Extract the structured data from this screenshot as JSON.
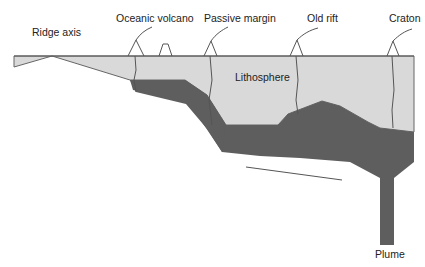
{
  "diagram": {
    "labels": {
      "ridge_axis": "Ridge axis",
      "oceanic_volcano": "Oceanic volcano",
      "passive_margin": "Passive margin",
      "old_rift": "Old rift",
      "craton": "Craton",
      "lithosphere": "Lithosphere",
      "plume": "Plume"
    },
    "colors": {
      "lithosphere_fill": "#d9d9d9",
      "plume_layer_fill": "#5e5e5e",
      "outline": "#555555",
      "text": "#222222"
    }
  }
}
